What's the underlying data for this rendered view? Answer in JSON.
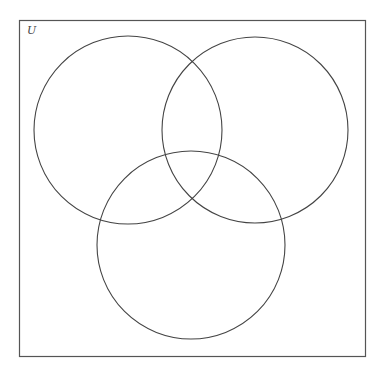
{
  "diagram": {
    "type": "venn-3",
    "universe": {
      "label": "U",
      "x": 19,
      "y": 20,
      "width": 346,
      "height": 336,
      "stroke": "#555555"
    },
    "sets": [
      {
        "name": "set-a",
        "cx": 128,
        "cy": 130,
        "r": 94,
        "stroke": "#444444"
      },
      {
        "name": "set-b",
        "cx": 255,
        "cy": 130,
        "r": 93,
        "stroke": "#444444"
      },
      {
        "name": "set-c",
        "cx": 191,
        "cy": 245,
        "r": 94,
        "stroke": "#444444"
      }
    ],
    "background": "#ffffff"
  }
}
